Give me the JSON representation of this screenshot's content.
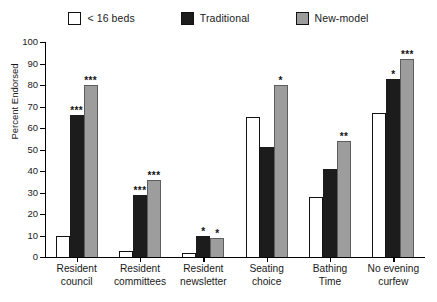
{
  "legend": {
    "items": [
      {
        "label": "< 16 beds",
        "swatch": "white-square-swatch",
        "color": "#ffffff"
      },
      {
        "label": "Traditional",
        "swatch": "black-square-swatch",
        "color": "#1c1c1c"
      },
      {
        "label": "New-model",
        "swatch": "gray-square-swatch",
        "color": "#9d9d9d"
      }
    ]
  },
  "axes": {
    "ylabel": "Percent Endorsed",
    "yticks": [
      "0",
      "10",
      "20",
      "30",
      "40",
      "50",
      "60",
      "70",
      "80",
      "90",
      "100"
    ]
  },
  "chart_data": {
    "type": "bar",
    "title": "",
    "xlabel": "",
    "ylabel": "Percent Endorsed",
    "ylim": [
      0,
      100
    ],
    "ytick_step": 10,
    "grid": false,
    "legend_position": "top-center",
    "categories": [
      "Resident council",
      "Resident committees",
      "Resident newsletter",
      "Seating choice",
      "Bathing Time",
      "No evening curfew"
    ],
    "category_lines": [
      [
        "Resident",
        "council"
      ],
      [
        "Resident",
        "committees"
      ],
      [
        "Resident",
        "newsletter"
      ],
      [
        "Seating",
        "choice"
      ],
      [
        "Bathing",
        "Time"
      ],
      [
        "No evening",
        "curfew"
      ]
    ],
    "series": [
      {
        "name": "< 16 beds",
        "color": "#ffffff",
        "values": [
          10,
          3,
          2,
          65,
          28,
          67
        ],
        "significance": [
          "",
          "",
          "",
          "",
          "",
          ""
        ]
      },
      {
        "name": "Traditional",
        "color": "#1c1c1c",
        "values": [
          66,
          29,
          10,
          51,
          41,
          83
        ],
        "significance": [
          "***",
          "***",
          "*",
          "",
          "",
          "*"
        ]
      },
      {
        "name": "New-model",
        "color": "#9d9d9d",
        "values": [
          80,
          36,
          9,
          80,
          54,
          92
        ],
        "significance": [
          "***",
          "***",
          "*",
          "*",
          "**",
          "***"
        ]
      }
    ],
    "significance_note": "* p<.05, ** p<.01, *** p<.001"
  }
}
